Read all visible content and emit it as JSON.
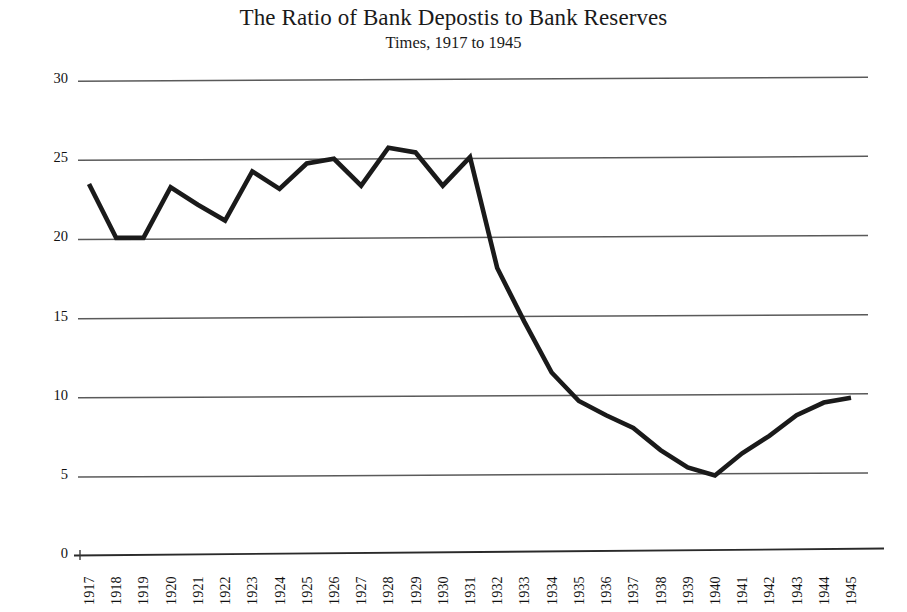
{
  "chart_data": {
    "type": "line",
    "title": "The Ratio of Bank Depostis to Bank Reserves",
    "subtitle": "Times, 1917 to 1945",
    "xlabel": "",
    "ylabel": "",
    "categories": [
      "1917",
      "1918",
      "1919",
      "1920",
      "1921",
      "1922",
      "1923",
      "1924",
      "1925",
      "1926",
      "1927",
      "1928",
      "1929",
      "1930",
      "1931",
      "1932",
      "1933",
      "1934",
      "1935",
      "1936",
      "1937",
      "1938",
      "1939",
      "1940",
      "1941",
      "1942",
      "1943",
      "1944",
      "1945"
    ],
    "values": [
      23.3,
      19.9,
      19.9,
      23.1,
      22.0,
      21.0,
      24.1,
      23.0,
      24.6,
      24.9,
      23.2,
      25.6,
      25.3,
      23.2,
      25.0,
      18.0,
      14.6,
      11.4,
      9.6,
      8.7,
      7.9,
      6.5,
      5.4,
      4.9,
      6.3,
      7.4,
      8.7,
      9.5,
      9.8
    ],
    "series": [
      {
        "name": "Ratio of bank deposits to bank reserves",
        "values": [
          23.3,
          19.9,
          19.9,
          23.1,
          22.0,
          21.0,
          24.1,
          23.0,
          24.6,
          24.9,
          23.2,
          25.6,
          25.3,
          23.2,
          25.0,
          18.0,
          14.6,
          11.4,
          9.6,
          8.7,
          7.9,
          6.5,
          5.4,
          4.9,
          6.3,
          7.4,
          8.7,
          9.5,
          9.8
        ]
      }
    ],
    "yticks": [
      0,
      5,
      10,
      15,
      20,
      25,
      30
    ],
    "ytick_labels": [
      "0",
      "5",
      "10",
      "15",
      "20",
      "25",
      "30"
    ],
    "ylim": [
      0,
      30
    ],
    "xlim": [
      "1917",
      "1945"
    ],
    "grid": "horizontal",
    "legend": "none",
    "line_color": "#1a1a1a",
    "grid_color": "#5a5a5a",
    "background_color": "#ffffff"
  }
}
